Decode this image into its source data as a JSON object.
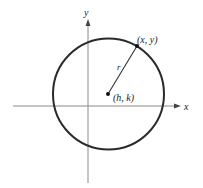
{
  "diagram": {
    "labels": {
      "y_axis": "y",
      "x_axis": "x",
      "point": "(x, y)",
      "center": "(h, k)",
      "radius": "r"
    },
    "colors": {
      "axis": "#8a8a8a",
      "circle": "#2a2a2a",
      "text": "#222222"
    }
  }
}
